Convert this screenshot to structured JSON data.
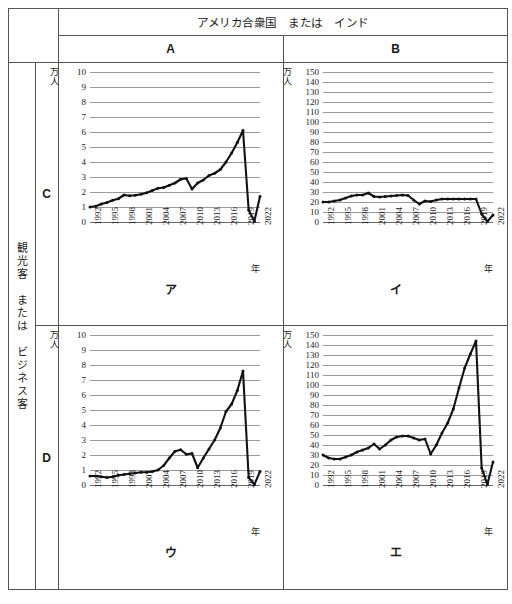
{
  "header": {
    "country_title": "アメリカ合衆国　または　インド",
    "col_a": "A",
    "col_b": "B"
  },
  "side": {
    "vertical_label": "観光客　または　ビジネス客",
    "row_c": "C",
    "row_d": "D"
  },
  "axis_common": {
    "y_unit_line1": "万",
    "y_unit_line2": "人",
    "x_unit": "年",
    "x_ticks": [
      "1992",
      "1995",
      "1998",
      "2001",
      "2004",
      "2007",
      "2010",
      "2013",
      "2016",
      "2019",
      "2022"
    ]
  },
  "panels": [
    {
      "key": "a",
      "label": "ア",
      "col": "A",
      "row": "C"
    },
    {
      "key": "i",
      "label": "イ",
      "col": "B",
      "row": "C"
    },
    {
      "key": "u",
      "label": "ウ",
      "col": "A",
      "row": "D"
    },
    {
      "key": "e",
      "label": "エ",
      "col": "B",
      "row": "D"
    }
  ],
  "chart_data": [
    {
      "id": "ア",
      "type": "line",
      "title": "ア",
      "xlabel": "年",
      "ylabel": "万人",
      "ylim": [
        0,
        10
      ],
      "ytick_values": [
        0,
        1,
        2,
        3,
        4,
        5,
        6,
        7,
        8,
        9,
        10
      ],
      "ytick_labels": [
        "0",
        "1",
        "2",
        "3",
        "4",
        "5",
        "6",
        "7",
        "8",
        "9",
        "10"
      ],
      "xlim": [
        1992,
        2022
      ],
      "x": [
        1992,
        1993,
        1994,
        1995,
        1996,
        1997,
        1998,
        1999,
        2000,
        2001,
        2002,
        2003,
        2004,
        2005,
        2006,
        2007,
        2008,
        2009,
        2010,
        2011,
        2012,
        2013,
        2014,
        2015,
        2016,
        2017,
        2018,
        2019,
        2020,
        2021,
        2022
      ],
      "values": [
        1.0,
        1.05,
        1.2,
        1.3,
        1.45,
        1.55,
        1.8,
        1.75,
        1.78,
        1.85,
        1.95,
        2.1,
        2.25,
        2.3,
        2.45,
        2.6,
        2.85,
        2.9,
        2.2,
        2.6,
        2.8,
        3.1,
        3.25,
        3.5,
        4.0,
        4.6,
        5.3,
        6.1,
        0.8,
        0.05,
        1.7
      ],
      "grid": true,
      "legend": null
    },
    {
      "id": "イ",
      "type": "line",
      "title": "イ",
      "xlabel": "年",
      "ylabel": "万人",
      "ylim": [
        0,
        150
      ],
      "ytick_values": [
        0,
        10,
        20,
        30,
        40,
        50,
        60,
        70,
        80,
        90,
        100,
        110,
        120,
        130,
        140,
        150
      ],
      "ytick_labels": [
        "0",
        "10",
        "20",
        "30",
        "40",
        "50",
        "60",
        "70",
        "80",
        "90",
        "100",
        "110",
        "120",
        "130",
        "140",
        "150"
      ],
      "xlim": [
        1992,
        2022
      ],
      "x": [
        1992,
        1993,
        1994,
        1995,
        1996,
        1997,
        1998,
        1999,
        2000,
        2001,
        2002,
        2003,
        2004,
        2005,
        2006,
        2007,
        2008,
        2009,
        2010,
        2011,
        2012,
        2013,
        2014,
        2015,
        2016,
        2017,
        2018,
        2019,
        2020,
        2021,
        2022
      ],
      "values": [
        20,
        20,
        21,
        22,
        24,
        26,
        27,
        27,
        29,
        25.5,
        25,
        25.5,
        26,
        26.5,
        27,
        26.5,
        22,
        18,
        21,
        20.5,
        22,
        23,
        23,
        23,
        23,
        23,
        23,
        23,
        8,
        0.5,
        7
      ],
      "grid": true,
      "legend": null
    },
    {
      "id": "ウ",
      "type": "line",
      "title": "ウ",
      "xlabel": "年",
      "ylabel": "万人",
      "ylim": [
        0,
        10
      ],
      "ytick_values": [
        0,
        1,
        2,
        3,
        4,
        5,
        6,
        7,
        8,
        9,
        10
      ],
      "ytick_labels": [
        "0",
        "1",
        "2",
        "3",
        "4",
        "5",
        "6",
        "7",
        "8",
        "9",
        "10"
      ],
      "xlim": [
        1992,
        2022
      ],
      "x": [
        1992,
        1993,
        1994,
        1995,
        1996,
        1997,
        1998,
        1999,
        2000,
        2001,
        2002,
        2003,
        2004,
        2005,
        2006,
        2007,
        2008,
        2009,
        2010,
        2011,
        2012,
        2013,
        2014,
        2015,
        2016,
        2017,
        2018,
        2019,
        2020,
        2021,
        2022
      ],
      "values": [
        0.6,
        0.6,
        0.55,
        0.5,
        0.55,
        0.65,
        0.7,
        0.75,
        0.8,
        0.85,
        0.85,
        0.9,
        1.0,
        1.3,
        1.8,
        2.25,
        2.35,
        2.05,
        2.1,
        1.15,
        1.8,
        2.4,
        3.0,
        3.8,
        4.9,
        5.4,
        6.3,
        7.6,
        0.5,
        0.02,
        0.9
      ],
      "grid": true,
      "legend": null
    },
    {
      "id": "エ",
      "type": "line",
      "title": "エ",
      "xlabel": "年",
      "ylabel": "万人",
      "ylim": [
        0,
        150
      ],
      "ytick_values": [
        0,
        10,
        20,
        30,
        40,
        50,
        60,
        70,
        80,
        90,
        100,
        110,
        120,
        130,
        140,
        150
      ],
      "ytick_labels": [
        "0",
        "10",
        "20",
        "30",
        "40",
        "50",
        "60",
        "70",
        "80",
        "90",
        "100",
        "110",
        "120",
        "130",
        "140",
        "150"
      ],
      "xlim": [
        1992,
        2022
      ],
      "x": [
        1992,
        1993,
        1994,
        1995,
        1996,
        1997,
        1998,
        1999,
        2000,
        2001,
        2002,
        2003,
        2004,
        2005,
        2006,
        2007,
        2008,
        2009,
        2010,
        2011,
        2012,
        2013,
        2014,
        2015,
        2016,
        2017,
        2018,
        2019,
        2020,
        2021,
        2022
      ],
      "values": [
        30,
        27,
        26,
        26,
        28,
        30,
        33,
        35,
        37,
        41,
        36,
        40,
        45,
        48,
        49,
        49,
        47,
        45,
        46,
        31,
        40,
        52,
        62,
        76,
        97,
        117,
        131,
        144,
        17,
        0.5,
        23
      ],
      "grid": true,
      "legend": null
    }
  ]
}
